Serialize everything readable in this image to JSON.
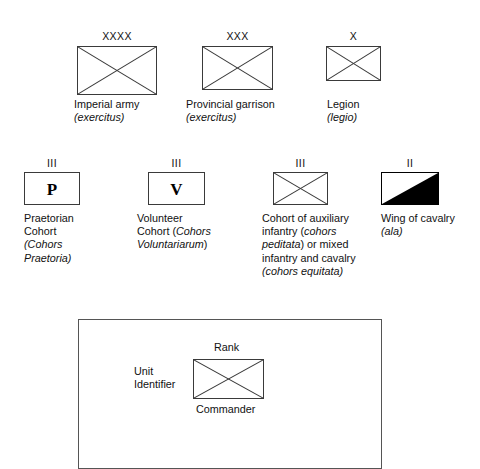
{
  "figure": {
    "background_color": "#ffffff",
    "line_color": "#3a3a3a"
  },
  "row1": {
    "items": [
      {
        "id": "imperial-army",
        "numeral": "XXXX",
        "symbol": "rectangle-with-saltire",
        "caption_line1": "Imperial army",
        "caption_line2_italic": "(exercitus)"
      },
      {
        "id": "provincial-garrison",
        "numeral": "XXX",
        "symbol": "rectangle-with-saltire",
        "caption_line1": "Provincial garrison",
        "caption_line2_italic": "(exercitus)"
      },
      {
        "id": "legion",
        "numeral": "X",
        "symbol": "rectangle-with-saltire",
        "caption_line1": "Legion",
        "caption_line2_italic": "(legio)"
      }
    ]
  },
  "row2": {
    "items": [
      {
        "id": "praetorian-cohort",
        "numeral": "III",
        "symbol": "rectangle-with-letter",
        "letter": "P",
        "caption_line1": "Praetorian",
        "caption_line2": "Cohort",
        "caption_line3_italic": "(Cohors",
        "caption_line4_italic": "Praetoria)"
      },
      {
        "id": "volunteer-cohort",
        "numeral": "III",
        "symbol": "rectangle-with-letter",
        "letter": "V",
        "caption_line1": "Volunteer",
        "caption_line2": "Cohort (",
        "caption_line2_italic": "Cohors",
        "caption_line3_italic": "Voluntariarum",
        "caption_line3_tail": ")"
      },
      {
        "id": "auxiliary-cohort",
        "numeral": "III",
        "symbol": "rectangle-with-saltire",
        "caption_line1": "Cohort of auxiliary",
        "caption_line2": "infantry (",
        "caption_line2_italic": "cohors",
        "caption_line3_italic": "peditata",
        "caption_line3_tail": ") or mixed",
        "caption_line4": "infantry and cavalry",
        "caption_line5_italic": "(cohors equitata)"
      },
      {
        "id": "cavalry-wing",
        "numeral": "II",
        "symbol": "rectangle-half-filled-diagonal",
        "caption_line1": "Wing of cavalry",
        "caption_line2_italic": "(ala)"
      }
    ]
  },
  "legend": {
    "rank_label": "Rank",
    "unit_identifier_label": "Unit\nIdentifier",
    "commander_label": "Commander",
    "symbol": "rectangle-with-saltire"
  }
}
